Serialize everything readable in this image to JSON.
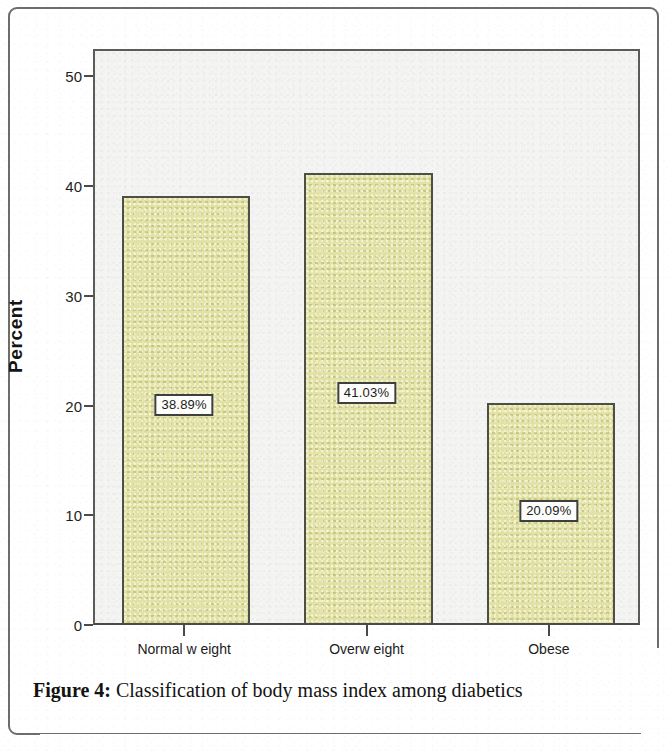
{
  "figure": {
    "caption_label": "Figure 4:",
    "caption_text": "Classification of body mass index among diabetics"
  },
  "chart_data": {
    "type": "bar",
    "title": "",
    "subtitle": "",
    "xlabel": "",
    "ylabel": "Percent",
    "categories": [
      "Normal w eight",
      "Overw eight",
      "Obese"
    ],
    "values": [
      38.89,
      41.03,
      20.09
    ],
    "data_labels": [
      "38.89%",
      "41.03%",
      "20.09%"
    ],
    "ylim": [
      0,
      52.5
    ],
    "yticks": [
      0,
      10,
      20,
      30,
      40,
      50
    ],
    "ytick_labels": [
      "0",
      "10",
      "20",
      "30",
      "40",
      "50"
    ],
    "grid": false,
    "legend": false,
    "legend_position": "none",
    "bar_color": "#e2e2a4",
    "bar_border_color": "#4f4f48",
    "plot_background": "#f4f4f2",
    "axis_color": "#4a4a46",
    "label_box_background": "#fdfdfb",
    "label_box_border": "#3f3f3c"
  }
}
